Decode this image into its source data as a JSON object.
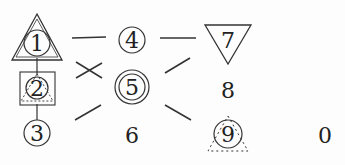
{
  "puzzle": {
    "cells": [
      {
        "label": "1",
        "x": 37,
        "y": 43,
        "shapes": [
          "triangle-up",
          "circle"
        ]
      },
      {
        "label": "2",
        "x": 37,
        "y": 88,
        "shapes": [
          "square",
          "circle",
          "dotted-triangle"
        ]
      },
      {
        "label": "3",
        "x": 37,
        "y": 133,
        "shapes": [
          "circle"
        ]
      },
      {
        "label": "4",
        "x": 132,
        "y": 40,
        "shapes": [
          "circle"
        ]
      },
      {
        "label": "5",
        "x": 132,
        "y": 87,
        "shapes": [
          "double-circle"
        ]
      },
      {
        "label": "6",
        "x": 132,
        "y": 135,
        "shapes": []
      },
      {
        "label": "7",
        "x": 228,
        "y": 43,
        "shapes": [
          "triangle-down"
        ]
      },
      {
        "label": "8",
        "x": 228,
        "y": 90,
        "shapes": []
      },
      {
        "label": "9",
        "x": 228,
        "y": 133,
        "shapes": [
          "circle",
          "dotted-triangle"
        ]
      },
      {
        "label": "0",
        "x": 325,
        "y": 135,
        "shapes": []
      }
    ],
    "connectors": [
      {
        "type": "horizontal",
        "between": [
          "1",
          "4"
        ]
      },
      {
        "type": "cross",
        "between": [
          "1",
          "5"
        ]
      },
      {
        "type": "slash",
        "between": [
          "3",
          "5"
        ]
      },
      {
        "type": "horizontal",
        "between": [
          "4",
          "7"
        ]
      },
      {
        "type": "slash",
        "between": [
          "5",
          "7"
        ]
      },
      {
        "type": "backslash",
        "between": [
          "5",
          "9"
        ]
      },
      {
        "type": "vertical",
        "between": [
          "1",
          "2"
        ]
      },
      {
        "type": "vertical",
        "between": [
          "2",
          "3"
        ]
      }
    ],
    "colors": {
      "ink": "#333333",
      "background": "#fdfdfd"
    }
  }
}
